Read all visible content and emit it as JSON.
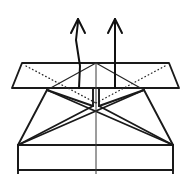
{
  "figure": {
    "canvas": {
      "width": 191,
      "height": 174
    },
    "colors": {
      "background": "#ffffff",
      "stroke": "#1a1a1a",
      "thin_stroke": "#262626",
      "dotted_stroke": "#2b2b2b",
      "center_line": "#3a3a3a",
      "arrow": "#111111"
    },
    "line_styles": {
      "solid": "solid",
      "dotted": "dotted",
      "arrow": "solid-with-open-head"
    }
  },
  "shapes": {
    "upper_band": {
      "name": "upper-band",
      "outline": "12,88 22,63 169,63 179,88 12,88",
      "left_chamfer": "12,88 22,63",
      "right_chamfer": "169,63 179,88",
      "top_edge": "22,63 169,63",
      "bottom_edge": "12,88 179,88"
    },
    "lower_body": {
      "name": "lower-body",
      "left_outline": "47,90 18,145 18,170",
      "right_outline": "144,90 173,145 173,170"
    },
    "base_rect": {
      "name": "base-rectangle",
      "top_edge": "18,145 173,145",
      "left_edge": "18,145 18,174",
      "right_edge": "173,145 173,174",
      "bottom_edge": "18,170 173,170"
    },
    "center_notch": {
      "name": "center-notch",
      "left_edge": "93,88 93,106",
      "right_edge": "99,88 99,106",
      "bottom": "93,106 99,106"
    },
    "center_axis": {
      "name": "center-vertical-axis",
      "path": "96,63 96,174"
    }
  },
  "creases": {
    "solid": [
      {
        "name": "crease-left-upper-diagonal",
        "path": "47,90 96,63"
      },
      {
        "name": "crease-right-upper-diagonal",
        "path": "144,90 96,63"
      },
      {
        "name": "crease-left-fan-upper",
        "path": "47,90 93,106"
      },
      {
        "name": "crease-right-fan-upper",
        "path": "144,90 99,106"
      },
      {
        "name": "crease-left-fan-lower",
        "path": "18,145 93,106"
      },
      {
        "name": "crease-right-fan-lower",
        "path": "173,145 99,106"
      },
      {
        "name": "crease-left-long-diagonal",
        "path": "47,90 173,145"
      },
      {
        "name": "crease-right-long-diagonal",
        "path": "144,90 18,145"
      }
    ],
    "dotted": [
      {
        "name": "fold-left-dotted-diagonal",
        "path": "26,66 96,103"
      },
      {
        "name": "fold-right-dotted-diagonal",
        "path": "165,66 96,103"
      }
    ]
  },
  "arrows": [
    {
      "name": "arrow-left-up",
      "label": "pull up left",
      "direction": "up",
      "shaft": "79,88 80,66 76,40 78,22",
      "head_left": "71,33 78,19",
      "head_right": "85,33 78,19",
      "tip": "78,19"
    },
    {
      "name": "arrow-right-up",
      "label": "pull up right",
      "direction": "up",
      "shaft": "115,88 115,22",
      "head_left": "108,33 115,19",
      "head_right": "122,33 115,19",
      "tip": "115,19"
    }
  ]
}
